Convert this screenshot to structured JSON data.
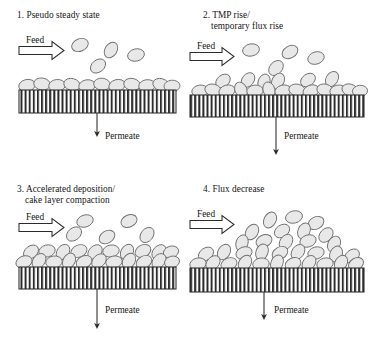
{
  "figure": {
    "caption_absent": true,
    "panel_count": 4,
    "background_color": "#ffffff",
    "line_color": "#2b2b2b",
    "particle_fill": "#e8e8e8",
    "particle_stroke": "#6f6f6f",
    "membrane_stripe_color": "#2b2b2b",
    "membrane_fill": "#ffffff"
  },
  "panels": [
    {
      "id": "panel-1",
      "number": "1.",
      "title_line_1": "1. Pseudo steady state",
      "title_line_2": "",
      "feed_label": "Feed",
      "permeate_label": "Permeate",
      "stage": "pseudo-steady-state",
      "cake_layer_description": "single sparse monolayer of particles on membrane",
      "suspended_particle_count": 4,
      "cake_particle_count": 11,
      "permeate_arrow_length": "short"
    },
    {
      "id": "panel-2",
      "number": "2.",
      "title_line_1": "2. TMP rise/",
      "title_line_2": "temporary flux rise",
      "feed_label": "Feed",
      "permeate_label": "Permeate",
      "stage": "tmp-rise-temporary-flux-rise",
      "cake_layer_description": "uneven cake layer about one and a half particles thick",
      "suspended_particle_count": 5,
      "cake_particle_count": 18,
      "permeate_arrow_length": "long"
    },
    {
      "id": "panel-3",
      "number": "3.",
      "title_line_1": "3. Accelerated deposition/",
      "title_line_2": "cake layer compaction",
      "feed_label": "Feed",
      "permeate_label": "Permeate",
      "stage": "accelerated-deposition-cake-compaction",
      "cake_layer_description": "uniform compacted cake layer two particles thick",
      "suspended_particle_count": 4,
      "cake_particle_count": 26,
      "permeate_arrow_length": "long"
    },
    {
      "id": "panel-4",
      "number": "4.",
      "title_line_1": "4. Flux decrease",
      "title_line_2": "",
      "feed_label": "Feed",
      "permeate_label": "Permeate",
      "stage": "flux-decrease",
      "cake_layer_description": "thick mounded cake layer several particles deep",
      "suspended_particle_count": 3,
      "cake_particle_count": 38,
      "permeate_arrow_length": "medium"
    }
  ]
}
